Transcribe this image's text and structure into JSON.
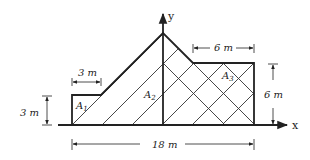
{
  "figure": {
    "axes": {
      "x_label": "x",
      "y_label": "y"
    },
    "areas": [
      {
        "name": "A",
        "sub": "1"
      },
      {
        "name": "A",
        "sub": "2"
      },
      {
        "name": "A",
        "sub": "3"
      }
    ],
    "dimensions": {
      "a1_width": "3 m",
      "a1_height": "3 m",
      "a3_width": "6 m",
      "a3_height": "6 m",
      "total_width": "18 m"
    },
    "colors": {
      "stroke": "#222222",
      "background": "#ffffff"
    }
  }
}
